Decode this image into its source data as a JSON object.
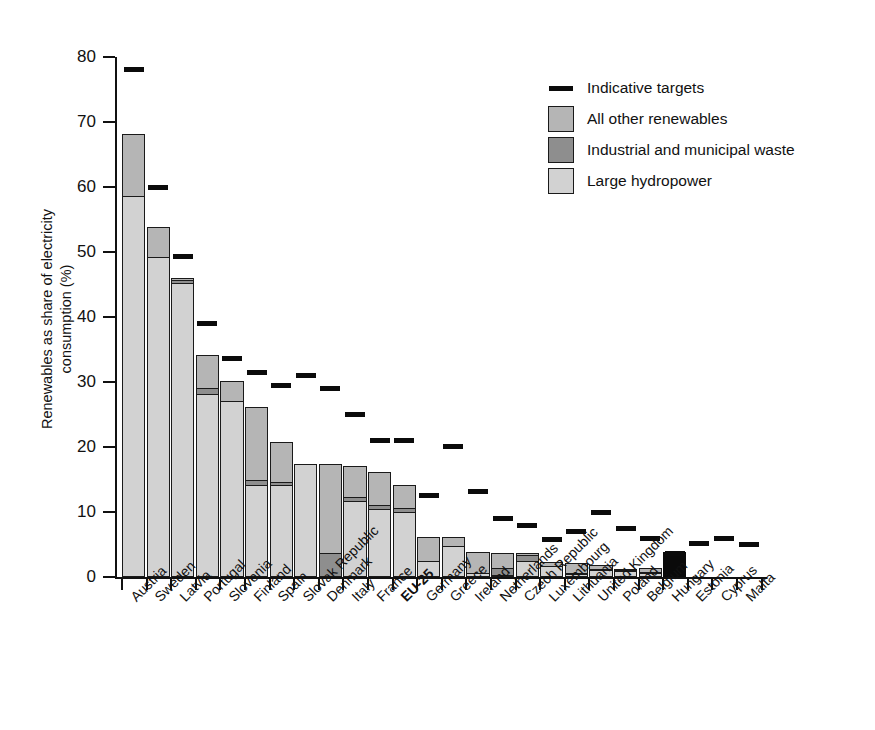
{
  "chart_data": {
    "type": "bar",
    "stacked": true,
    "title": "",
    "xlabel": "",
    "ylabel": "Renewables as share of electricity consumption (%)",
    "ylim": [
      0,
      80
    ],
    "yticks": [
      0,
      10,
      20,
      30,
      40,
      50,
      60,
      70,
      80
    ],
    "grid": false,
    "legend_position": "top-right",
    "categories": [
      "Austria",
      "Sweden",
      "Latvia",
      "Portugal",
      "Slovenia",
      "Finland",
      "Spain",
      "Slovak Republic",
      "Denmark",
      "Italy",
      "France",
      "EU-25",
      "Germany",
      "Greece",
      "Ireland",
      "Netherlands",
      "Czech Republic",
      "Luxembourg",
      "Lithuania",
      "United Kingdom",
      "Poland",
      "Belgium",
      "Hungary",
      "Estonia",
      "Cyprus",
      "Malta"
    ],
    "highlight_category": "EU-25",
    "series": [
      {
        "name": "Large hydropower",
        "color": "#d2d2d2",
        "values": [
          58.5,
          49.0,
          45.0,
          28.0,
          27.0,
          14.0,
          14.0,
          17.2,
          0.0,
          11.6,
          10.3,
          9.8,
          2.3,
          4.6,
          0.5,
          0.1,
          2.3,
          1.5,
          0.3,
          0.9,
          0.8,
          0.4,
          0.0,
          0.0,
          0.0,
          0.0
        ]
      },
      {
        "name": "Industrial and municipal waste",
        "color": "#8e8e8e",
        "values": [
          0.0,
          0.0,
          0.6,
          1.0,
          0.0,
          0.8,
          0.5,
          0.0,
          3.5,
          0.5,
          0.6,
          0.6,
          0.0,
          0.0,
          0.0,
          1.2,
          0.9,
          0.0,
          0.1,
          0.2,
          0.1,
          0.2,
          0.0,
          0.0,
          0.0,
          0.0
        ]
      },
      {
        "name": "All other renewables",
        "color": "#b5b5b5",
        "values": [
          9.5,
          4.6,
          0.2,
          5.0,
          3.0,
          11.1,
          6.0,
          0.0,
          13.7,
          4.8,
          5.1,
          3.6,
          3.7,
          1.3,
          3.1,
          2.2,
          0.3,
          0.6,
          1.6,
          0.6,
          0.1,
          0.5,
          0.0,
          0.0,
          0.0,
          0.0
        ]
      },
      {
        "name": "Hungary (single solid bar)",
        "color": "#0a0a0a",
        "values": [
          0,
          0,
          0,
          0,
          0,
          0,
          0,
          0,
          0,
          0,
          0,
          0,
          0,
          0,
          0,
          0,
          0,
          0,
          0,
          0,
          0,
          0,
          3.6,
          0,
          0,
          0
        ]
      }
    ],
    "totals": [
      68.0,
      53.6,
      45.8,
      34.0,
      30.0,
      25.9,
      20.5,
      17.2,
      17.2,
      16.9,
      16.0,
      14.0,
      6.0,
      5.9,
      3.6,
      3.5,
      3.5,
      2.1,
      2.0,
      1.7,
      1.0,
      1.1,
      3.6,
      0.2,
      0.1,
      0.0
    ],
    "targets": {
      "name": "Indicative targets",
      "color": "#0b0b0b",
      "values": [
        78.1,
        60.0,
        49.3,
        39.0,
        33.6,
        31.5,
        29.4,
        31.0,
        29.0,
        25.0,
        21.0,
        21.0,
        12.5,
        20.1,
        13.2,
        9.0,
        8.0,
        5.7,
        7.0,
        10.0,
        7.5,
        6.0,
        3.6,
        5.1,
        6.0,
        5.0
      ]
    },
    "legend": [
      {
        "label": "Indicative targets",
        "key": "dash",
        "color": "#0b0b0b"
      },
      {
        "label": "All other renewables",
        "key": "swatch",
        "color": "#b5b5b5"
      },
      {
        "label": "Industrial and municipal waste",
        "key": "swatch",
        "color": "#8e8e8e"
      },
      {
        "label": "Large hydropower",
        "key": "swatch",
        "color": "#d2d2d2"
      }
    ]
  }
}
